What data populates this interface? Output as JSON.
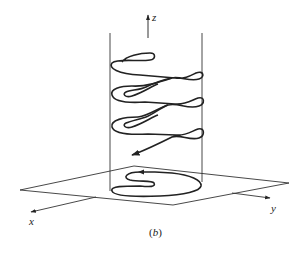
{
  "figure": {
    "caption_open": "(",
    "caption_letter": "b",
    "caption_close": ")",
    "stroke_color": "#222222",
    "background": "#ffffff"
  },
  "axes": {
    "z": {
      "label": "z"
    },
    "x": {
      "label": "x"
    },
    "y": {
      "label": "y"
    }
  }
}
